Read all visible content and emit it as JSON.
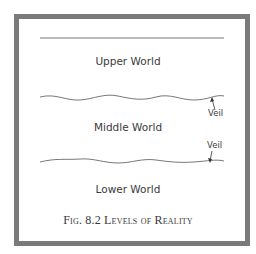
{
  "diagram": {
    "levels": [
      {
        "label": "Upper World"
      },
      {
        "label": "Middle World"
      },
      {
        "label": "Lower World"
      }
    ],
    "veils": [
      {
        "label": "Veil"
      },
      {
        "label": "Veil"
      }
    ],
    "caption": "Fig. 8.2 Levels of Reality",
    "colors": {
      "frame": "#7a7a7a",
      "lines": "#555555",
      "text": "#3a3a3a"
    }
  }
}
